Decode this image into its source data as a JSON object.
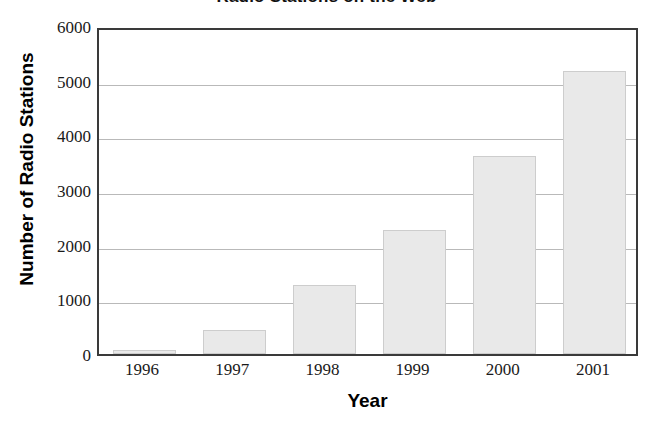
{
  "chart_data": {
    "type": "bar",
    "title": "Radio Stations on the Web",
    "xlabel": "Year",
    "ylabel": "Number of Radio Stations",
    "categories": [
      "1996",
      "1997",
      "1998",
      "1999",
      "2000",
      "2001"
    ],
    "values": [
      70,
      440,
      1260,
      2270,
      3620,
      5170
    ],
    "ylim": [
      0,
      6000
    ],
    "ytick_labels": [
      "0",
      "1000",
      "2000",
      "3000",
      "4000",
      "5000",
      "6000"
    ],
    "ytick_values": [
      0,
      1000,
      2000,
      3000,
      4000,
      5000,
      6000
    ],
    "grid": true,
    "legend": "none",
    "bar_fill_color": "#e9e9e9",
    "bar_border_color": "#cdcdcd",
    "gridline_color": "#b9b9b9",
    "frame_color": "#3a3a3a",
    "background_color": "#ffffff"
  }
}
